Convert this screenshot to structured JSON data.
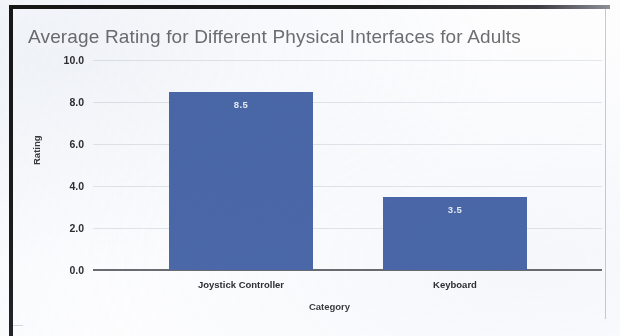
{
  "chart_data": {
    "type": "bar",
    "title": "Average Rating for Different Physical Interfaces for Adults",
    "xlabel": "Category",
    "ylabel": "Rating",
    "categories": [
      "Joystick Controller",
      "Keyboard"
    ],
    "values": [
      8.5,
      3.5
    ],
    "value_labels": [
      "8.5",
      "3.5"
    ],
    "ylim": [
      0.0,
      10.0
    ],
    "yticks": [
      10.0,
      8.0,
      6.0,
      4.0,
      2.0,
      0.0
    ],
    "ytick_labels": [
      "10.0",
      "8.0",
      "6.0",
      "4.0",
      "2.0",
      "0.0"
    ],
    "grid": true,
    "legend": null,
    "bar_color": "#4b68a8",
    "title_color": "#6e6e72",
    "grid_color": "#e3e6ea",
    "axis_color": "#6a6c70"
  }
}
